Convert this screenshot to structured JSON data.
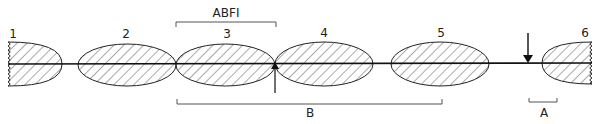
{
  "segments": [
    {
      "label": "1",
      "cx": 8,
      "cy": 64,
      "rx": 54,
      "ry": 22,
      "type": "half-left-cut"
    },
    {
      "label": "2",
      "cx": 127,
      "cy": 65,
      "rx": 49,
      "ry": 21,
      "type": "ellipse"
    },
    {
      "label": "3",
      "cx": 225,
      "cy": 65,
      "rx": 50,
      "ry": 21,
      "type": "ellipse"
    },
    {
      "label": "4",
      "cx": 324,
      "cy": 64,
      "rx": 50,
      "ry": 22,
      "type": "ellipse"
    },
    {
      "label": "5",
      "cx": 440,
      "cy": 64,
      "rx": 49,
      "ry": 22,
      "type": "ellipse"
    },
    {
      "label": "6",
      "cx": 592,
      "cy": 63,
      "rx": 50,
      "ry": 21,
      "type": "half-right-cut"
    }
  ],
  "labels": {
    "seg1": "1",
    "seg2": "2",
    "seg3": "3",
    "seg4": "4",
    "seg5": "5",
    "seg6": "6",
    "abfi": "ABFI",
    "b": "B",
    "a": "A"
  },
  "colors": {
    "line": "#111111",
    "hatch": "#333333",
    "bracket": "#555555"
  }
}
